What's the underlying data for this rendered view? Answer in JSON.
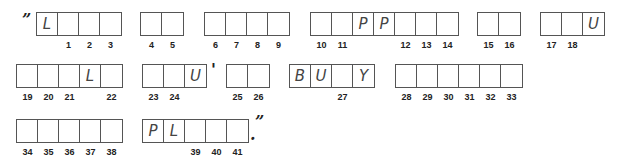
{
  "puzzle": {
    "open_quote": "”",
    "apostrophe": "'",
    "end_period": ".",
    "close_quote": "”",
    "words": [
      {
        "cells": [
          {
            "letter": "L",
            "num": ""
          },
          {
            "letter": "",
            "num": "1"
          },
          {
            "letter": "",
            "num": "2"
          },
          {
            "letter": "",
            "num": "3"
          }
        ]
      },
      {
        "cells": [
          {
            "letter": "",
            "num": "4"
          },
          {
            "letter": "",
            "num": "5"
          }
        ]
      },
      {
        "cells": [
          {
            "letter": "",
            "num": "6"
          },
          {
            "letter": "",
            "num": "7"
          },
          {
            "letter": "",
            "num": "8"
          },
          {
            "letter": "",
            "num": "9"
          }
        ]
      },
      {
        "cells": [
          {
            "letter": "",
            "num": "10"
          },
          {
            "letter": "",
            "num": "11"
          },
          {
            "letter": "P",
            "num": ""
          },
          {
            "letter": "P",
            "num": ""
          },
          {
            "letter": "",
            "num": "12"
          },
          {
            "letter": "",
            "num": "13"
          },
          {
            "letter": "",
            "num": "14"
          }
        ]
      },
      {
        "cells": [
          {
            "letter": "",
            "num": "15"
          },
          {
            "letter": "",
            "num": "16"
          }
        ]
      },
      {
        "cells": [
          {
            "letter": "",
            "num": "17"
          },
          {
            "letter": "",
            "num": "18"
          },
          {
            "letter": "U",
            "num": ""
          }
        ]
      },
      {
        "cells": [
          {
            "letter": "",
            "num": "19"
          },
          {
            "letter": "",
            "num": "20"
          },
          {
            "letter": "",
            "num": "21"
          },
          {
            "letter": "L",
            "num": ""
          },
          {
            "letter": "",
            "num": "22"
          }
        ]
      },
      {
        "cells": [
          {
            "letter": "",
            "num": "23"
          },
          {
            "letter": "",
            "num": "24"
          },
          {
            "letter": "U",
            "num": ""
          }
        ]
      },
      {
        "cells": [
          {
            "letter": "",
            "num": "25"
          },
          {
            "letter": "",
            "num": "26"
          }
        ]
      },
      {
        "cells": [
          {
            "letter": "B",
            "num": ""
          },
          {
            "letter": "U",
            "num": ""
          },
          {
            "letter": "",
            "num": "27"
          },
          {
            "letter": "Y",
            "num": ""
          }
        ]
      },
      {
        "cells": [
          {
            "letter": "",
            "num": "28"
          },
          {
            "letter": "",
            "num": "29"
          },
          {
            "letter": "",
            "num": "30"
          },
          {
            "letter": "",
            "num": "31"
          },
          {
            "letter": "",
            "num": "32"
          },
          {
            "letter": "",
            "num": "33"
          }
        ]
      },
      {
        "cells": [
          {
            "letter": "",
            "num": "34"
          },
          {
            "letter": "",
            "num": "35"
          },
          {
            "letter": "",
            "num": "36"
          },
          {
            "letter": "",
            "num": "37"
          },
          {
            "letter": "",
            "num": "38"
          }
        ]
      },
      {
        "cells": [
          {
            "letter": "P",
            "num": ""
          },
          {
            "letter": "L",
            "num": ""
          },
          {
            "letter": "",
            "num": "39"
          },
          {
            "letter": "",
            "num": "40"
          },
          {
            "letter": "",
            "num": "41"
          }
        ]
      }
    ]
  }
}
